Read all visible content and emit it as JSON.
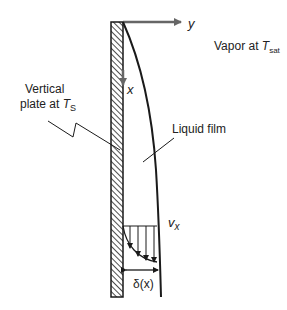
{
  "diagram": {
    "labels": {
      "y_axis": "y",
      "x_axis": "x",
      "vapor_prefix": "Vapor at ",
      "vapor_T": "T",
      "vapor_sub": "sat",
      "plate_line1": "Vertical",
      "plate_line2": "plate at ",
      "plate_T": "T",
      "plate_sub": "S",
      "liquid_film": "Liquid film",
      "velocity_v": "v",
      "velocity_sub": "x",
      "thickness": "δ(x)"
    },
    "colors": {
      "line": "#1a1a1a",
      "axis_arrow": "#666666",
      "text": "#222222"
    }
  }
}
